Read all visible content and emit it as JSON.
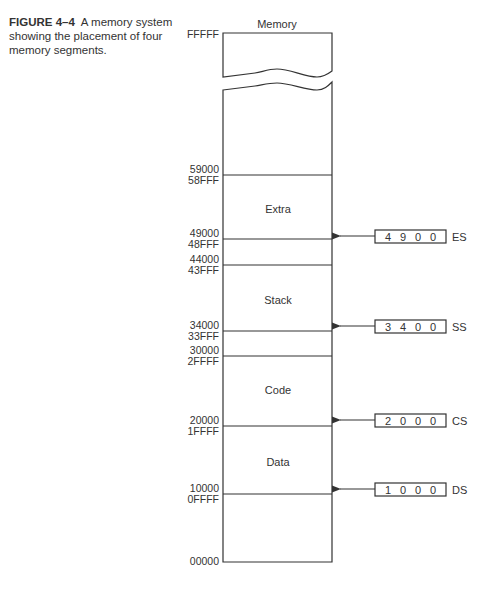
{
  "caption": {
    "figure_number": "FIGURE 4–4",
    "text": "A memory system showing the placement of four memory segments."
  },
  "diagram": {
    "title": "Memory",
    "top_address": "FFFFF",
    "bottom_address": "00000",
    "boundaries": [
      {
        "upper": "59000",
        "lower": "58FFF"
      },
      {
        "upper": "49000",
        "lower": "48FFF"
      },
      {
        "upper": "44000",
        "lower": "43FFF"
      },
      {
        "upper": "34000",
        "lower": "33FFF"
      },
      {
        "upper": "30000",
        "lower": "2FFFF"
      },
      {
        "upper": "20000",
        "lower": "1FFFF"
      },
      {
        "upper": "10000",
        "lower": "0FFFF"
      }
    ],
    "segments": [
      {
        "name": "Extra"
      },
      {
        "name": "Stack"
      },
      {
        "name": "Code"
      },
      {
        "name": "Data"
      }
    ],
    "registers": [
      {
        "digits": [
          "4",
          "9",
          "0",
          "0"
        ],
        "name": "ES"
      },
      {
        "digits": [
          "3",
          "4",
          "0",
          "0"
        ],
        "name": "SS"
      },
      {
        "digits": [
          "2",
          "0",
          "0",
          "0"
        ],
        "name": "CS"
      },
      {
        "digits": [
          "1",
          "0",
          "0",
          "0"
        ],
        "name": "DS"
      }
    ]
  }
}
